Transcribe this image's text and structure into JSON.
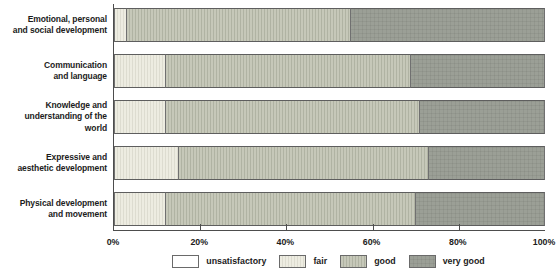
{
  "chart_data": {
    "type": "bar",
    "orientation": "horizontal",
    "stacked": true,
    "title": "",
    "xlabel": "",
    "ylabel": "",
    "xlim": [
      0,
      100
    ],
    "x_ticks": [
      "0%",
      "20%",
      "40%",
      "60%",
      "80%",
      "100%"
    ],
    "x_tick_values": [
      0,
      20,
      40,
      60,
      80,
      100
    ],
    "grid": false,
    "legend_position": "bottom",
    "categories": [
      "Emotional, personal\nand social development",
      "Communication\nand language",
      "Knowledge and\nunderstanding of the world",
      "Expressive and\naesthetic development",
      "Physical development\nand movement"
    ],
    "series": [
      {
        "name": "unsatisfactory",
        "values": [
          0,
          0,
          0,
          0,
          0
        ],
        "color": "#ffffff",
        "stripe": "#ffffff",
        "pattern": "plain"
      },
      {
        "name": "fair",
        "values": [
          3,
          12,
          12,
          15,
          12
        ],
        "color": "#edece1",
        "stripe": "#dddcd0",
        "pattern": "hatch-v"
      },
      {
        "name": "good",
        "values": [
          52,
          57,
          59,
          58,
          58
        ],
        "color": "#c6c8b9",
        "stripe": "#b0b3a3",
        "pattern": "hatch-v"
      },
      {
        "name": "very good",
        "values": [
          45,
          31,
          29,
          27,
          30
        ],
        "color": "#9b9f96",
        "stripe": "#93978e",
        "pattern": "grid"
      }
    ],
    "axis_color": "#4d4d4d",
    "bar_border_color": "#5e5e5e"
  }
}
